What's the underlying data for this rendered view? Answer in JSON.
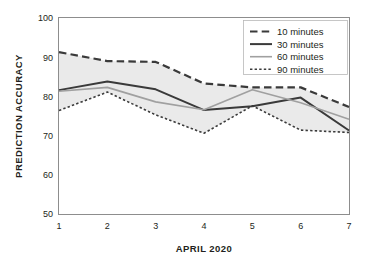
{
  "chart_data": {
    "type": "line",
    "title": "",
    "xlabel": "APRIL 2020",
    "ylabel": "PREDICTION ACCURACY",
    "x": [
      1,
      2,
      3,
      4,
      5,
      6,
      7
    ],
    "xtick_labels": [
      "1",
      "2",
      "3",
      "4",
      "5",
      "6",
      "7"
    ],
    "ytick_labels": [
      "50",
      "60",
      "70",
      "80",
      "90",
      "100"
    ],
    "yticks": [
      50,
      60,
      70,
      80,
      90,
      100
    ],
    "ylim": [
      50,
      100
    ],
    "xlim": [
      1,
      7
    ],
    "grid": false,
    "legend_position": "top-right",
    "band": {
      "description": "shaded region between 10 minutes (upper) and 90 minutes (lower)",
      "color": "#e9e9e9",
      "upper_series": "10 minutes",
      "lower_series": "90 minutes"
    },
    "series": [
      {
        "name": "10 minutes",
        "values": [
          91.3,
          89.0,
          88.8,
          83.3,
          82.3,
          82.3,
          77.3
        ],
        "style": "dashed",
        "color": "#3a3a3a",
        "width": 2.2
      },
      {
        "name": "30 minutes",
        "values": [
          81.6,
          83.8,
          81.8,
          76.5,
          77.5,
          79.7,
          71.3
        ],
        "style": "solid",
        "color": "#3a3a3a",
        "width": 2.0
      },
      {
        "name": "60 minutes",
        "values": [
          81.3,
          82.3,
          78.6,
          76.6,
          81.7,
          78.4,
          74.2
        ],
        "style": "solid",
        "color": "#a0a0a0",
        "width": 1.6
      },
      {
        "name": "90 minutes",
        "values": [
          76.4,
          81.1,
          75.3,
          70.6,
          77.6,
          71.4,
          70.8
        ],
        "style": "dotted",
        "color": "#3a3a3a",
        "width": 1.6
      }
    ]
  },
  "legend": {
    "entries": [
      {
        "label": "10 minutes"
      },
      {
        "label": "30 minutes"
      },
      {
        "label": "60 minutes"
      },
      {
        "label": "90 minutes"
      }
    ]
  },
  "colors": {
    "dark_line": "#3a3a3a",
    "gray_line": "#a0a0a0",
    "band_fill": "#e9e9e9",
    "frame": "#8d8d8d",
    "text": "#231f20",
    "background": "#ffffff"
  }
}
